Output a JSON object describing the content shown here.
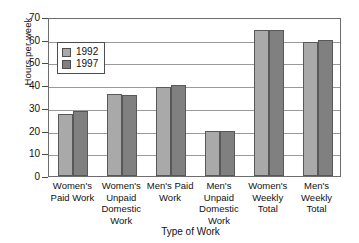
{
  "chart_data": {
    "type": "bar",
    "title": "",
    "xlabel": "Type of Work",
    "ylabel": "Hours per week",
    "categories": [
      "Women's Paid Work",
      "Women's Unpaid Domestic Work",
      "Men's Paid Work",
      "Men's Unpaid Domestic Work",
      "Women's Weekly Total",
      "Men's Weekly Total"
    ],
    "category_lines": [
      [
        "Women's",
        "Paid Work"
      ],
      [
        "Women's",
        "Unpaid",
        "Domestic",
        "Work"
      ],
      [
        "Men's Paid",
        "Work"
      ],
      [
        "Men's",
        "Unpaid",
        "Domestic",
        "Work"
      ],
      [
        "Women's",
        "Weekly",
        "Total"
      ],
      [
        "Men's",
        "Weekly",
        "Total"
      ]
    ],
    "series": [
      {
        "name": "1992",
        "color": "#a9a9a9",
        "values": [
          27.5,
          36,
          39,
          20,
          64.5,
          59
        ]
      },
      {
        "name": "1997",
        "color": "#808080",
        "values": [
          28.5,
          35.5,
          40,
          20,
          64.5,
          60
        ]
      }
    ],
    "ylim": [
      0,
      70
    ],
    "ytick_values": [
      0,
      10,
      20,
      30,
      40,
      50,
      60,
      70
    ],
    "ytick_labels": [
      "0",
      "10",
      "20",
      "30",
      "40",
      "50",
      "60",
      "70"
    ],
    "grid": true,
    "legend_position": "upper-left-inside"
  }
}
